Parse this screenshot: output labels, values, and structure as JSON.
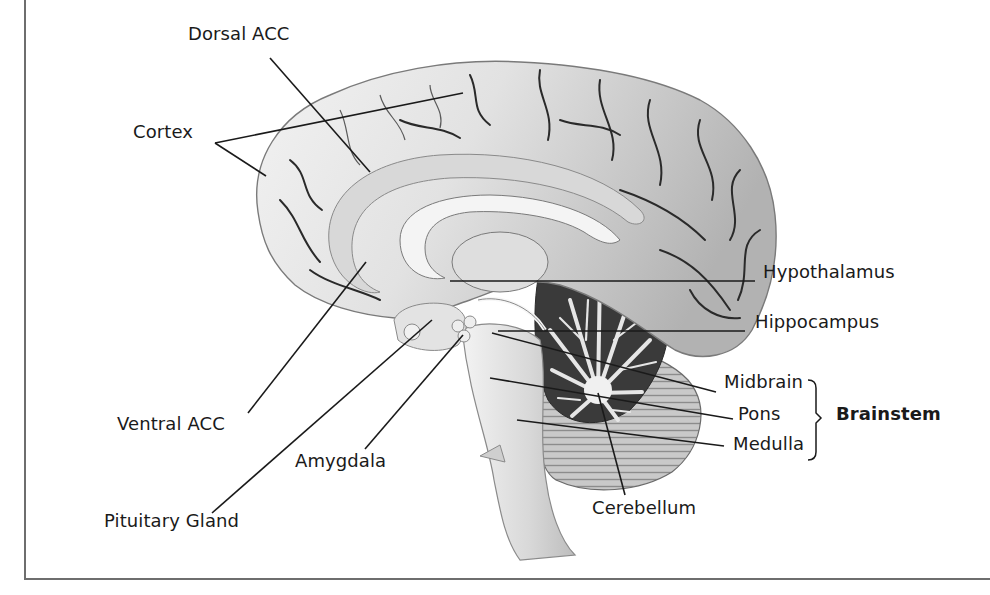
{
  "figure": {
    "colors": {
      "background": "#ffffff",
      "ink": "#1a1a1a",
      "cortex_light": "#e9e9e9",
      "cortex_mid": "#cfcfcf",
      "cortex_dark": "#a9a9a9",
      "sulcus": "#2a2a2a",
      "cerebellum_dark": "#3a3a3a",
      "border": "#6e6e6e"
    },
    "labels": {
      "dorsal_acc": "Dorsal ACC",
      "cortex": "Cortex",
      "hypothalamus": "Hypothalamus",
      "hippocampus": "Hippocampus",
      "midbrain": "Midbrain",
      "pons": "Pons",
      "medulla": "Medulla",
      "brainstem": "Brainstem",
      "ventral_acc": "Ventral ACC",
      "amygdala": "Amygdala",
      "pituitary_gland": "Pituitary Gland",
      "cerebellum": "Cerebellum"
    },
    "label_positions": {
      "dorsal_acc": [
        188,
        34
      ],
      "cortex": [
        133,
        132
      ],
      "hypothalamus": [
        763,
        272
      ],
      "hippocampus": [
        755,
        322
      ],
      "midbrain": [
        724,
        382
      ],
      "pons": [
        738,
        414
      ],
      "medulla": [
        733,
        444
      ],
      "brainstem": [
        836,
        414
      ],
      "ventral_acc": [
        117,
        424
      ],
      "amygdala": [
        295,
        461
      ],
      "pituitary_gland": [
        104,
        521
      ],
      "cerebellum": [
        592,
        508
      ]
    },
    "leader_lines": [
      {
        "name": "dorsal-acc-line",
        "x1": 270,
        "y1": 58,
        "x2": 370,
        "y2": 172
      },
      {
        "name": "cortex-line-upper",
        "x1": 215,
        "y1": 143,
        "x2": 463,
        "y2": 93
      },
      {
        "name": "cortex-line-lower",
        "x1": 215,
        "y1": 143,
        "x2": 266,
        "y2": 176
      },
      {
        "name": "hypothalamus-line",
        "x1": 450,
        "y1": 281,
        "x2": 755,
        "y2": 281
      },
      {
        "name": "hippocampus-line",
        "x1": 498,
        "y1": 331,
        "x2": 745,
        "y2": 331
      },
      {
        "name": "midbrain-line",
        "x1": 492,
        "y1": 333,
        "x2": 716,
        "y2": 392
      },
      {
        "name": "pons-line",
        "x1": 490,
        "y1": 378,
        "x2": 733,
        "y2": 419
      },
      {
        "name": "medulla-line",
        "x1": 517,
        "y1": 420,
        "x2": 724,
        "y2": 446
      },
      {
        "name": "ventral-acc-line",
        "x1": 248,
        "y1": 413,
        "x2": 366,
        "y2": 262
      },
      {
        "name": "pituitary-line",
        "x1": 212,
        "y1": 513,
        "x2": 432,
        "y2": 320
      },
      {
        "name": "amygdala-line",
        "x1": 365,
        "y1": 449,
        "x2": 463,
        "y2": 335
      },
      {
        "name": "cerebellum-line",
        "x1": 625,
        "y1": 495,
        "x2": 598,
        "y2": 393
      }
    ],
    "bracket": {
      "x": 812,
      "y_top": 380,
      "y_mid": 418,
      "y_bottom": 460
    }
  }
}
